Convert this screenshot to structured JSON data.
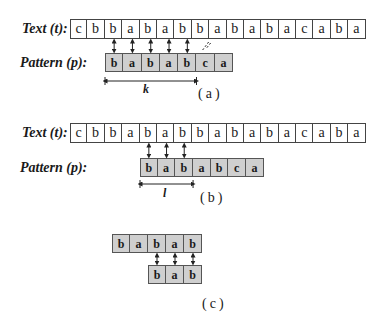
{
  "labels": {
    "text": "Text (t):",
    "pattern": "Pattern (p):"
  },
  "panels": [
    {
      "id": "a",
      "caption": "(a)",
      "text": [
        "c",
        "b",
        "b",
        "a",
        "b",
        "a",
        "b",
        "b",
        "a",
        "b",
        "a",
        "b",
        "a",
        "c",
        "a",
        "b",
        "a"
      ],
      "pattern": [
        "b",
        "a",
        "b",
        "a",
        "b",
        "c",
        "a"
      ],
      "pattern_offset": 2,
      "matches": [
        2,
        3,
        4,
        5,
        6
      ],
      "mismatch": 7,
      "span_label": "k",
      "span_length": 5
    },
    {
      "id": "b",
      "caption": "(b)",
      "text": [
        "c",
        "b",
        "b",
        "a",
        "b",
        "a",
        "b",
        "b",
        "a",
        "b",
        "a",
        "b",
        "a",
        "c",
        "a",
        "b",
        "a"
      ],
      "pattern": [
        "b",
        "a",
        "b",
        "a",
        "b",
        "c",
        "a"
      ],
      "pattern_offset": 4,
      "matches": [
        4,
        5,
        6
      ],
      "span_label": "l",
      "span_length": 3
    },
    {
      "id": "c",
      "caption": "(c)",
      "top": [
        "b",
        "a",
        "b",
        "a",
        "b"
      ],
      "bottom": [
        "b",
        "a",
        "b"
      ],
      "bottom_offset": 2,
      "matches": [
        2,
        3,
        4
      ]
    }
  ]
}
